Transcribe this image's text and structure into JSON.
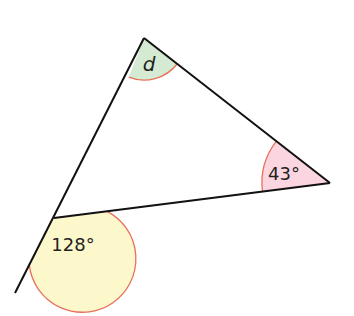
{
  "diagram": {
    "type": "triangle-exterior-angle",
    "vertices": {
      "top": {
        "x": 144,
        "y": 38
      },
      "right": {
        "x": 330,
        "y": 183
      },
      "left": {
        "x": 54,
        "y": 218
      }
    },
    "extension_end": {
      "x": 15,
      "y": 293
    },
    "angles": {
      "top": {
        "label": "d",
        "fill": "#d4ead2",
        "arc": "#e8705a"
      },
      "right": {
        "label": "43°",
        "fill": "#fbd6e0",
        "arc": "#e8705a"
      },
      "exterior": {
        "label": "128°",
        "fill": "#fdf8cc",
        "arc": "#e8705a"
      }
    },
    "line_color": "#111111"
  }
}
